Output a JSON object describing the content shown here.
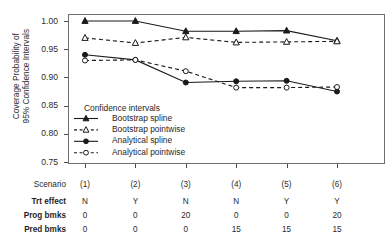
{
  "chart_data": {
    "type": "line",
    "title": "",
    "xlabel": "",
    "ylabel": "Coverage Probability of\n95% Confidence Intervals",
    "ylabel_line1": "Coverage Probability of",
    "ylabel_line2": "95% Confidence Intervals",
    "categories": [
      "(1)",
      "(2)",
      "(3)",
      "(4)",
      "(5)",
      "(6)"
    ],
    "ylim": [
      0.75,
      1.0
    ],
    "yticks": [
      "1.00",
      "0.95",
      "0.90",
      "0.85",
      "0.80",
      "0.75"
    ],
    "ytick_values": [
      1.0,
      0.95,
      0.9,
      0.85,
      0.8,
      0.75
    ],
    "grid": false,
    "legend_position": "center-left-inside",
    "legend_title": "Confidence intervals",
    "series": [
      {
        "name": "Bootstrap spline",
        "marker": "filled-triangle",
        "line": "solid",
        "values": [
          1.0,
          1.0,
          0.982,
          0.982,
          0.983,
          0.965
        ]
      },
      {
        "name": "Bootstrap pointwise",
        "marker": "open-triangle",
        "line": "dashed",
        "values": [
          0.97,
          0.961,
          0.971,
          0.962,
          0.963,
          0.964
        ]
      },
      {
        "name": "Analytical spline",
        "marker": "filled-circle",
        "line": "solid",
        "values": [
          0.94,
          0.931,
          0.891,
          0.893,
          0.894,
          0.875
        ]
      },
      {
        "name": "Analytical pointwise",
        "marker": "open-circle",
        "line": "dashed",
        "values": [
          0.93,
          0.931,
          0.911,
          0.882,
          0.882,
          0.883
        ]
      }
    ]
  },
  "scenario_table": {
    "row_labels": [
      "Scenario",
      "Trt effect",
      "Prog bmks",
      "Pred bmks"
    ],
    "rows": [
      {
        "label": "Scenario",
        "values": [
          "(1)",
          "(2)",
          "(3)",
          "(4)",
          "(5)",
          "(6)"
        ]
      },
      {
        "label": "Trt effect",
        "values": [
          "N",
          "Y",
          "N",
          "N",
          "Y",
          "Y"
        ]
      },
      {
        "label": "Prog bmks",
        "values": [
          "0",
          "0",
          "20",
          "0",
          "0",
          "20"
        ]
      },
      {
        "label": "Pred bmks",
        "values": [
          "0",
          "0",
          "0",
          "15",
          "15",
          "15"
        ]
      }
    ]
  },
  "colors": {
    "series_color": "#1a1a1a",
    "axis_color": "#4a4a4a",
    "frame_color": "#6e6e6e",
    "background": "#ffffff"
  }
}
